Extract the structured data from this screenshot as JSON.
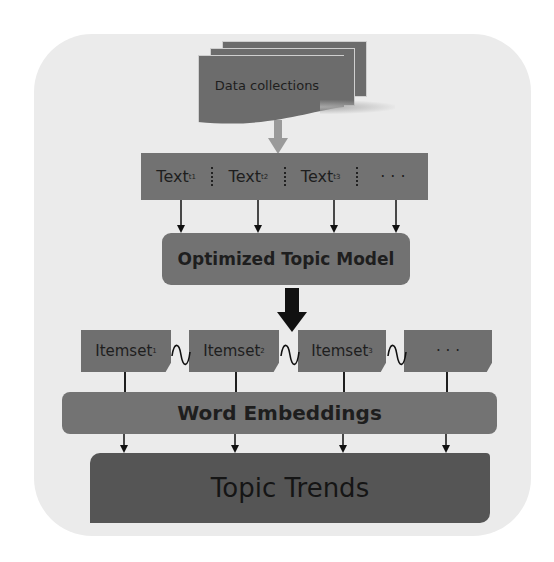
{
  "diagram": {
    "source_node": {
      "label": "Data collections"
    },
    "text_row": {
      "cells": [
        {
          "base": "Text",
          "sub": "t1"
        },
        {
          "base": "Text",
          "sub": "t2"
        },
        {
          "base": "Text",
          "sub": "t3"
        },
        {
          "base": "· · ·",
          "sub": ""
        }
      ]
    },
    "model_node": {
      "label": "Optimized Topic Model"
    },
    "itemsets": [
      {
        "base": "Itemset",
        "sub": "1"
      },
      {
        "base": "Itemset",
        "sub": "2"
      },
      {
        "base": "Itemset",
        "sub": "3"
      },
      {
        "base": "· · ·",
        "sub": ""
      }
    ],
    "embedding_node": {
      "label": "Word Embeddings"
    },
    "output_node": {
      "label": "Topic Trends"
    },
    "colors": {
      "background_card": "#ebebeb",
      "box_fill": "#727272",
      "output_fill": "#555555",
      "arrow_dark": "#111111",
      "arrow_light": "#9a9a9a"
    }
  }
}
